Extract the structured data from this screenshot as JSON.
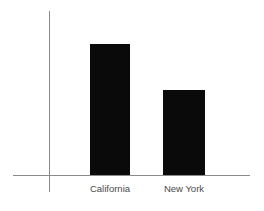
{
  "chart_data": {
    "type": "bar",
    "title": "",
    "subtitle": "",
    "xlabel": "",
    "ylabel": "",
    "categories": [
      "California",
      "New York"
    ],
    "values": [
      131,
      85
    ],
    "series": [
      {
        "name": "",
        "values": [
          131,
          85
        ]
      }
    ],
    "ylim": [
      0,
      164
    ],
    "grid": false,
    "legend": false,
    "legend_position": "none",
    "annotations": [],
    "tick_labels_x": [
      "California",
      "New York"
    ],
    "tick_labels_y": [],
    "colors": {
      "bar": "#0a0a0a",
      "axis": "#8a8a8a",
      "label_text": "#4a4a4a",
      "background": "#ffffff"
    }
  },
  "chart": {
    "bars": [
      {
        "label": "California",
        "value": 131,
        "left_px": 90,
        "width_px": 40,
        "height_px": 131
      },
      {
        "label": "New York",
        "value": 85,
        "left_px": 163,
        "width_px": 42,
        "height_px": 85
      }
    ],
    "axes": {
      "y_axis_name": "value-axis",
      "x_axis_name": "category-axis"
    }
  }
}
